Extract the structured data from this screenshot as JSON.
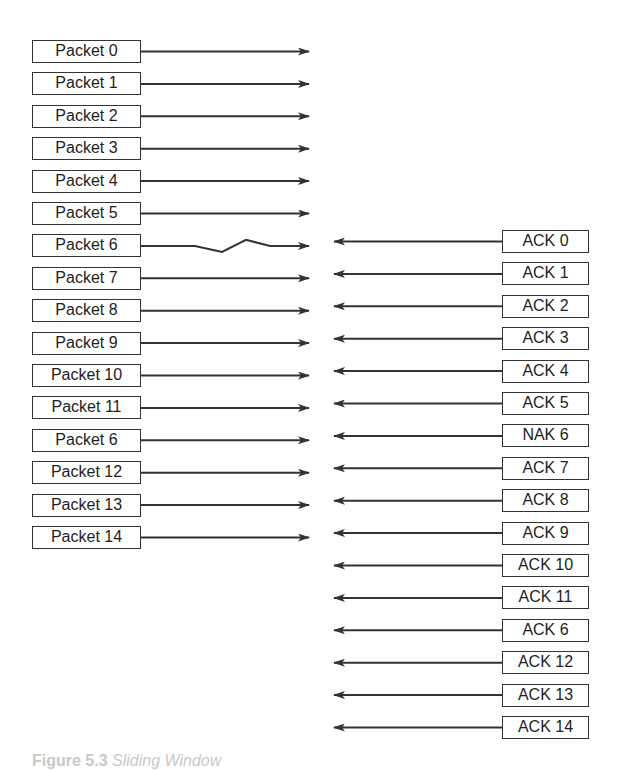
{
  "diagram": {
    "sender_packets": [
      {
        "label": "Packet 0",
        "lost": false
      },
      {
        "label": "Packet 1",
        "lost": false
      },
      {
        "label": "Packet 2",
        "lost": false
      },
      {
        "label": "Packet 3",
        "lost": false
      },
      {
        "label": "Packet 4",
        "lost": false
      },
      {
        "label": "Packet 5",
        "lost": false
      },
      {
        "label": "Packet 6",
        "lost": true
      },
      {
        "label": "Packet 7",
        "lost": false
      },
      {
        "label": "Packet 8",
        "lost": false
      },
      {
        "label": "Packet 9",
        "lost": false
      },
      {
        "label": "Packet 10",
        "lost": false
      },
      {
        "label": "Packet 11",
        "lost": false
      },
      {
        "label": "Packet 6",
        "lost": false
      },
      {
        "label": "Packet 12",
        "lost": false
      },
      {
        "label": "Packet 13",
        "lost": false
      },
      {
        "label": "Packet 14",
        "lost": false
      }
    ],
    "receiver_responses": [
      {
        "label": "ACK 0"
      },
      {
        "label": "ACK 1"
      },
      {
        "label": "ACK 2"
      },
      {
        "label": "ACK 3"
      },
      {
        "label": "ACK 4"
      },
      {
        "label": "ACK 5"
      },
      {
        "label": "NAK 6"
      },
      {
        "label": "ACK 7"
      },
      {
        "label": "ACK 8"
      },
      {
        "label": "ACK 9"
      },
      {
        "label": "ACK 10"
      },
      {
        "label": "ACK 11"
      },
      {
        "label": "ACK 6"
      },
      {
        "label": "ACK 12"
      },
      {
        "label": "ACK 13"
      },
      {
        "label": "ACK 14"
      }
    ],
    "caption": {
      "number": "Figure 5.3",
      "text": "Sliding Window"
    }
  }
}
